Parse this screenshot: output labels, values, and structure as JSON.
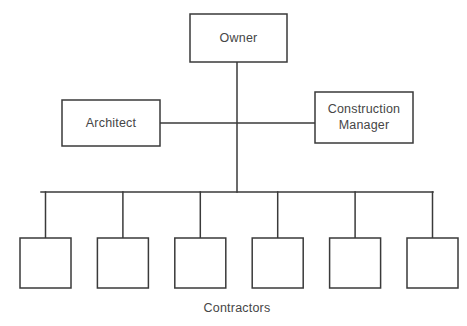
{
  "diagram": {
    "type": "organizational-chart",
    "background_color": "#ffffff",
    "line_color": "#3a3a3a",
    "text_color": "#464646",
    "nodes": {
      "owner": {
        "label": "Owner",
        "x": 190,
        "y": 14,
        "width": 97,
        "height": 48
      },
      "architect": {
        "label": "Architect",
        "x": 62,
        "y": 100,
        "width": 98,
        "height": 46
      },
      "construction_manager": {
        "label_line1": "Construction",
        "label_line2": "Manager",
        "x": 315,
        "y": 92,
        "width": 98,
        "height": 51
      }
    },
    "contractors": {
      "caption": "Contractors",
      "caption_x": 237,
      "caption_y": 309,
      "count": 6,
      "box_width": 51,
      "box_height": 50,
      "box_top": 238,
      "first_box_left": 20,
      "pitch": 77.4,
      "labels": [
        "",
        "",
        "",
        "",
        "",
        ""
      ]
    },
    "connectors": {
      "spine_x": 237,
      "spine_top": 62,
      "spine_bottom": 192,
      "peer_line_y": 123,
      "peer_line_left": 160,
      "peer_line_right": 315,
      "trunk_y": 192,
      "trunk_left": 41,
      "trunk_right": 433,
      "stub_bottom": 238
    }
  }
}
